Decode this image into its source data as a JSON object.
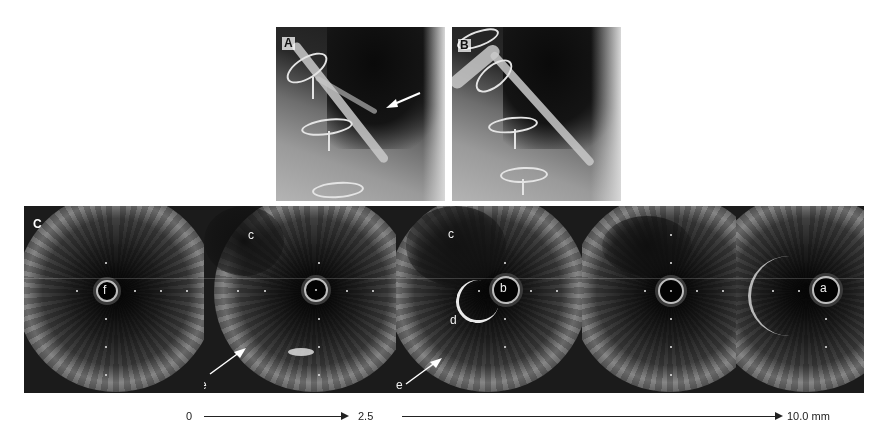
{
  "figure": {
    "panels": {
      "A": {
        "label": "A",
        "content": "coronary angiogram with arrow indicating lesion"
      },
      "B": {
        "label": "B",
        "content": "coronary angiogram"
      },
      "C": {
        "label": "C",
        "content": "IVUS pullback cross-sections",
        "frames": [
          {
            "id": "frame-1",
            "labels": [
              {
                "text": "f",
                "pos": "lumen"
              }
            ]
          },
          {
            "id": "frame-2",
            "labels": [
              {
                "text": "c",
                "pos": "upper-left"
              },
              {
                "text": "e",
                "pos": "lower-left-arrow"
              }
            ]
          },
          {
            "id": "frame-3",
            "labels": [
              {
                "text": "c",
                "pos": "upper-left"
              },
              {
                "text": "b",
                "pos": "lumen"
              },
              {
                "text": "d",
                "pos": "left"
              },
              {
                "text": "e",
                "pos": "lower-left-arrow"
              }
            ]
          },
          {
            "id": "frame-4",
            "labels": []
          },
          {
            "id": "frame-5",
            "labels": [
              {
                "text": "a",
                "pos": "lumen"
              }
            ]
          }
        ]
      }
    },
    "scale_bar": {
      "start": "0",
      "mid": "2.5",
      "end": "10.0 mm"
    },
    "colors": {
      "background": "#ffffff",
      "ivus_dark": "#141414",
      "annotation": "#f0f0f0",
      "scale_text": "#222222"
    }
  }
}
